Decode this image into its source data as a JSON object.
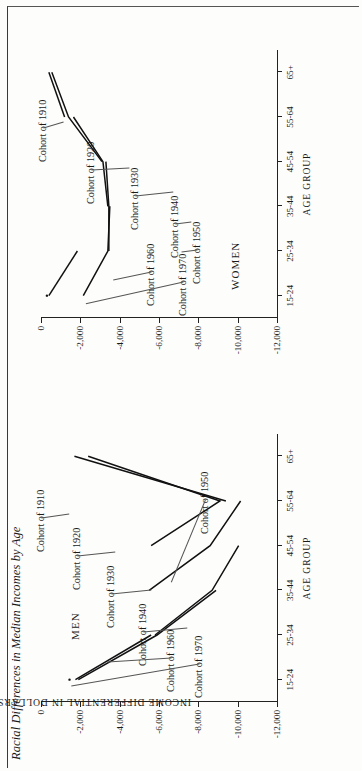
{
  "figure": {
    "title": "Racial Differences in Median Incomes by Age",
    "y_axis_title": "INCOME DIFFERENTIAL IN DOLLARS",
    "x_axis_title": "AGE GROUP",
    "panel_men_label": "MEN",
    "panel_women_label": "WOMEN"
  },
  "chart_data": {
    "type": "line",
    "title": "Racial Differences in Median Incomes by Age",
    "xlabel": "AGE GROUP",
    "ylabel": "INCOME DIFFERENTIAL IN DOLLARS",
    "categories": [
      "15-24",
      "25-34",
      "35-44",
      "45-54",
      "55-64",
      "65+"
    ],
    "ylim": [
      -12000,
      0
    ],
    "yticks": [
      0,
      -2000,
      -4000,
      -6000,
      -8000,
      -10000,
      -12000
    ],
    "ytick_labels": [
      "0",
      "-2,000",
      "-4,000",
      "-6,000",
      "-8,000",
      "-10,000",
      "-12,000"
    ],
    "grid": false,
    "legend": "inline-annotations",
    "panels": [
      {
        "name": "MEN",
        "series": [
          {
            "name": "Cohort of 1970",
            "x": [
              "15-24"
            ],
            "values": [
              -1450
            ]
          },
          {
            "name": "Cohort of 1960",
            "x": [
              "15-24",
              "25-34"
            ],
            "values": [
              -1750,
              -5600
            ]
          },
          {
            "name": "Cohort of 1950",
            "x": [
              "15-24",
              "25-34",
              "35-44"
            ],
            "values": [
              -1900,
              -5900,
              -8900
            ]
          },
          {
            "name": "Cohort of 1940",
            "x": [
              "25-34",
              "35-44",
              "45-54"
            ],
            "values": [
              -5800,
              -8700,
              -10050
            ]
          },
          {
            "name": "Cohort of 1930",
            "x": [
              "35-44",
              "45-54",
              "55-64"
            ],
            "values": [
              -5500,
              -8600,
              -10150
            ]
          },
          {
            "name": "Cohort of 1920",
            "x": [
              "45-54",
              "55-64",
              "65+"
            ],
            "values": [
              -5600,
              -9100,
              -2400
            ]
          },
          {
            "name": "Cohort of 1910",
            "x": [
              "55-64",
              "65+"
            ],
            "values": [
              -9400,
              -1700
            ]
          }
        ]
      },
      {
        "name": "WOMEN",
        "series": [
          {
            "name": "Cohort of 1970",
            "x": [
              "15-24"
            ],
            "values": [
              -300
            ]
          },
          {
            "name": "Cohort of 1960",
            "x": [
              "15-24",
              "25-34"
            ],
            "values": [
              -400,
              -1850
            ]
          },
          {
            "name": "Cohort of 1950",
            "x": [
              "15-24",
              "25-34",
              "35-44"
            ],
            "values": [
              -2150,
              -3400,
              -3500
            ]
          },
          {
            "name": "Cohort of 1940",
            "x": [
              "25-34",
              "35-44",
              "45-54"
            ],
            "values": [
              -3450,
              -3450,
              -3300
            ]
          },
          {
            "name": "Cohort of 1930",
            "x": [
              "35-44",
              "45-54",
              "55-64"
            ],
            "values": [
              -3400,
              -3150,
              -1650
            ]
          },
          {
            "name": "Cohort of 1920",
            "x": [
              "45-54",
              "55-64",
              "65+"
            ],
            "values": [
              -3100,
              -1400,
              -550
            ]
          },
          {
            "name": "Cohort of 1910",
            "x": [
              "55-64",
              "65+"
            ],
            "values": [
              -1200,
              -400
            ]
          }
        ]
      }
    ]
  },
  "annotations": {
    "men": [
      {
        "label": "Cohort of 1910"
      },
      {
        "label": "Cohort of 1920"
      },
      {
        "label": "Cohort of 1930"
      },
      {
        "label": "Cohort of 1940"
      },
      {
        "label": "Cohort of 1950"
      },
      {
        "label": "Cohort of 1960"
      },
      {
        "label": "Cohort of 1970"
      }
    ],
    "women": [
      {
        "label": "Cohort of 1910"
      },
      {
        "label": "Cohort of 1920"
      },
      {
        "label": "Cohort of 1930"
      },
      {
        "label": "Cohort of 1940"
      },
      {
        "label": "Cohort of 1950"
      },
      {
        "label": "Cohort of 1960"
      },
      {
        "label": "Cohort of 1970"
      }
    ]
  },
  "colors": {
    "line": "#111111",
    "axis": "#222222",
    "text": "#1a1a1a",
    "page": "#fdfdfc"
  }
}
